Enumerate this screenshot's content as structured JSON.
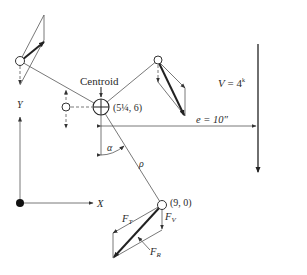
{
  "diagram": {
    "labels": {
      "centroid": "Centroid",
      "centroid_coords": "(5¼, 6)",
      "load": "V = 4ᵏ",
      "load_prefix": "V",
      "load_value": " = 4",
      "load_unit": "k",
      "eccentricity": "e = 10″",
      "alpha": "α",
      "rho": "ρ",
      "x_axis": "X",
      "y_axis": "Y",
      "bolt_coords": "(9, 0)",
      "ft_main": "F",
      "ft_sub": "T",
      "fv_main": "F",
      "fv_sub": "V",
      "fr_main": "F",
      "fr_sub": "R"
    },
    "colors": {
      "ink": "#222222",
      "background": "#ffffff"
    },
    "elements": {
      "centroid": {
        "x": 101,
        "y": 107,
        "r": 8
      },
      "bolts": [
        {
          "name": "top-left-bolt",
          "x": 20,
          "y": 61
        },
        {
          "name": "middle-left-bolt",
          "x": 66,
          "y": 107
        },
        {
          "name": "top-right-bolt",
          "x": 158,
          "y": 60
        },
        {
          "name": "critical-bolt",
          "x": 162,
          "y": 205
        }
      ],
      "origin": {
        "x": 20,
        "y": 203
      },
      "load_line": {
        "x": 258,
        "y1": 44,
        "y2": 173
      }
    }
  }
}
